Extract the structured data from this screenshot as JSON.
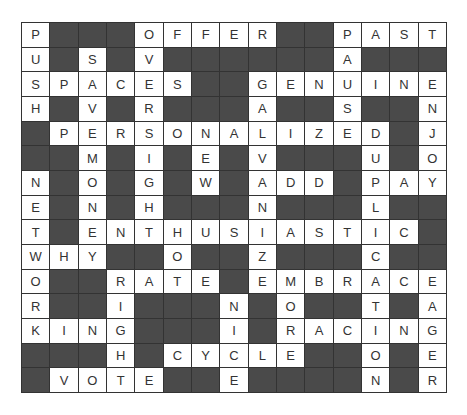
{
  "puzzle": {
    "type": "crossword",
    "rows": 15,
    "cols": 15,
    "block_color": "#4a4a4a",
    "grid": [
      "P###OFFER##PAST",
      "U#S#V######A###",
      "SPACES##GENUINE",
      "H#V#R###A##S##N",
      "#PERSONALIZED#J",
      "##M#I#E#V###U#O",
      "N#O#G#W#ADD#PAY",
      "E#N#H###N###L##",
      "T#ENTHUSIASTIC#",
      "WHY##O##Z###C##",
      "O##RATE#EMBRACE",
      "R##I###N#O##T#A",
      "KING###I#RACING",
      "###H#CYCLE##O#E",
      "#VOTE##E####N#R"
    ],
    "words": {
      "across": [
        "OFFER",
        "PAST",
        "SPACES",
        "GENUINE",
        "PERSONALIZED",
        "ADD",
        "PAY",
        "ENTHUSIASTIC",
        "WHY",
        "RATE",
        "EMBRACE",
        "KING",
        "RACING",
        "CYCLE",
        "VOTE"
      ],
      "down": [
        "PUSH",
        "SAVE",
        "OVERSIGHT",
        "NETWORK",
        "MONEY",
        "NEW",
        "GALVANIZE",
        "NICE",
        "PAUSED",
        "DUPLICATION",
        "ENJOY",
        "MOR",
        "EAGER",
        "RIGHT",
        "TEN"
      ]
    }
  }
}
